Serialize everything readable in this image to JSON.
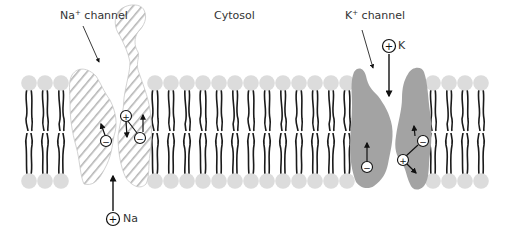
{
  "diagram": {
    "labels": {
      "na_channel": "Na",
      "na_channel_sup": "+",
      "na_channel_suffix": " channel",
      "cytosol": "Cytosol",
      "k_channel": "K",
      "k_channel_sup": "+",
      "k_channel_suffix": " channel"
    },
    "ions": {
      "sodium": {
        "symbol": "Na",
        "charge": "+"
      },
      "potassium": {
        "symbol": "K",
        "charge": "+"
      }
    },
    "charges": {
      "positive": "+",
      "negative": "−"
    },
    "colors": {
      "lipid_head": "#dcdcdc",
      "lipid_tail": "#1a1a1a",
      "na_channel_stripe": "#b8b8b8",
      "k_channel_fill": "#a3a3a3",
      "text": "#333333"
    },
    "membrane": {
      "top_head_y": 83,
      "bottom_head_y": 181,
      "head_spacing": 16
    }
  }
}
